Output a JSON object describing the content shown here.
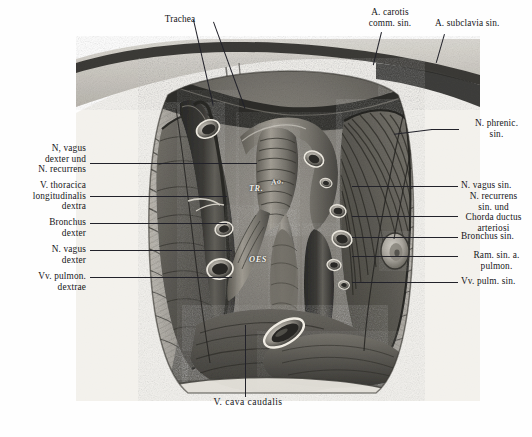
{
  "plate": {
    "medium": "halftone engraving",
    "subject": "thoracic cavity dissection, mediastinum from ventral aspect",
    "paper_color": "#fefefe",
    "ink_color": "#16161a"
  },
  "labels": {
    "top": [
      {
        "id": "trachea",
        "text": "Trachea",
        "align": "center"
      },
      {
        "id": "a-carotis-comm-sin",
        "text": "A. carotis\ncomm. sin.",
        "align": "center"
      },
      {
        "id": "a-subclavia-sin",
        "text": "A. subclavia sin.",
        "align": "left"
      }
    ],
    "left": [
      {
        "id": "n-vagus-dexter-und-n-recurrens",
        "text": "N, vagus\ndexter und\nN. recurrens"
      },
      {
        "id": "v-thoracica-longitudinalis-dextra",
        "text": "V. thoracica\nlongitudinalis\ndextra"
      },
      {
        "id": "bronchus-dexter",
        "text": "Bronchus\ndexter"
      },
      {
        "id": "n-vagus-dexter",
        "text": "N. vagus\ndexter"
      },
      {
        "id": "vv-pulmon-dextrae",
        "text": "Vv. pulmon.\ndextrae"
      }
    ],
    "right": [
      {
        "id": "n-phrenic-sin",
        "text": "N. phrenic.\nsin."
      },
      {
        "id": "n-vagus-sin",
        "text": "N. vagus sin."
      },
      {
        "id": "n-recurrens-sin-und-chorda-ductus-arteriosi",
        "text": "N. recurrens\nsin. und\nChorda ductus\narteriosi"
      },
      {
        "id": "bronchus-sin",
        "text": "Bronchus sin."
      },
      {
        "id": "ram-sin-a-pulmon",
        "text": "Ram. sin. a.\npulmon."
      },
      {
        "id": "vv-pulm-sin",
        "text": "Vv. pulm. sin."
      }
    ],
    "bottom": [
      {
        "id": "v-cava-caudalis",
        "text": "V. cava caudalis"
      }
    ],
    "interior": [
      {
        "id": "trachea-abbrev",
        "text": "TR."
      },
      {
        "id": "aorta-abbrev",
        "text": "Ao."
      },
      {
        "id": "oesophagus-abbrev",
        "text": "OES"
      }
    ]
  }
}
